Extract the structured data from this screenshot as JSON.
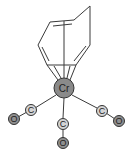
{
  "diagram": {
    "colors": {
      "metal_fill": "#8a8a8a",
      "carbon_fill": "#d4d4d4",
      "oxygen_fill": "#8f8f8f",
      "bond": "#3a3a3a"
    },
    "metal": {
      "label": "Cr",
      "x": 64,
      "y": 88,
      "r": 10
    },
    "carbonyls": [
      {
        "c_label": "C",
        "o_label": "O",
        "cx": 31,
        "cy": 110,
        "ox": 14,
        "oy": 119
      },
      {
        "c_label": "C",
        "o_label": "O",
        "cx": 63,
        "cy": 124,
        "ox": 63,
        "oy": 143
      },
      {
        "c_label": "C",
        "o_label": "O",
        "cx": 102,
        "cy": 111,
        "ox": 119,
        "oy": 121
      }
    ],
    "ring_label": "cycloheptatriene"
  }
}
